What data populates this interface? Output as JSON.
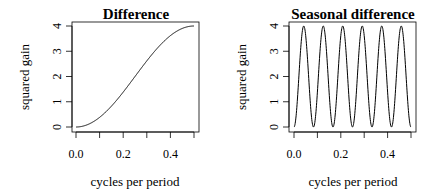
{
  "chart_data": [
    {
      "type": "line",
      "title": "Difference",
      "xlabel": "cycles per period",
      "ylabel": "squared gain",
      "xlim": [
        0,
        0.5
      ],
      "ylim": [
        0,
        4
      ],
      "xticks": [
        0.0,
        0.1,
        0.2,
        0.3,
        0.4,
        0.5
      ],
      "xtick_labels": [
        "0.0",
        "",
        "0.2",
        "",
        "0.4",
        ""
      ],
      "yticks": [
        0,
        1,
        2,
        3,
        4
      ],
      "ytick_labels": [
        "0",
        "1",
        "2",
        "3",
        "4"
      ],
      "grid": false,
      "function": "2 - 2*cos(2*pi*f)",
      "x": [
        0.0,
        0.05,
        0.1,
        0.15,
        0.2,
        0.25,
        0.3,
        0.35,
        0.4,
        0.45,
        0.5
      ],
      "values": [
        0.0,
        0.098,
        0.382,
        0.824,
        1.382,
        2.0,
        2.618,
        3.176,
        3.618,
        3.902,
        4.0
      ]
    },
    {
      "type": "line",
      "title": "Seasonal difference",
      "xlabel": "cycles per period",
      "ylabel": "squared gain",
      "xlim": [
        0,
        0.5
      ],
      "ylim": [
        0,
        4
      ],
      "xticks": [
        0.0,
        0.1,
        0.2,
        0.3,
        0.4,
        0.5
      ],
      "xtick_labels": [
        "0.0",
        "",
        "0.2",
        "",
        "0.4",
        ""
      ],
      "yticks": [
        0,
        1,
        2,
        3,
        4
      ],
      "ytick_labels": [
        "0",
        "1",
        "2",
        "3",
        "4"
      ],
      "grid": false,
      "function": "2 - 2*cos(24*pi*f)",
      "period": 12,
      "peaks_x": [
        0.0417,
        0.125,
        0.2083,
        0.2917,
        0.375,
        0.4583
      ],
      "peak_value": 4,
      "troughs_x": [
        0.0,
        0.0833,
        0.1667,
        0.25,
        0.3333,
        0.4167,
        0.5
      ],
      "trough_value": 0
    }
  ],
  "panels": [
    {
      "title": "Difference",
      "xlabel": "cycles per period",
      "ylabel": "squared gain",
      "freq_mult": 1
    },
    {
      "title": "Seasonal difference",
      "xlabel": "cycles per period",
      "ylabel": "squared gain",
      "freq_mult": 12
    }
  ]
}
